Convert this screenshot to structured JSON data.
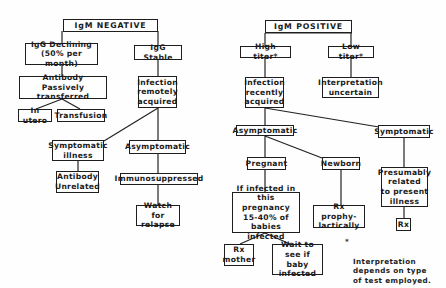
{
  "diagram": {
    "left_tree": {
      "root": "IgM NEGATIVE",
      "igg_declining": "IgG Declining\n(50% per month)",
      "igg_stable": "IgG Stable",
      "antibody_passive": "Antibody\nPassively transferred",
      "in_utero": "In utero",
      "transfusion": "Transfusion",
      "infection_remote": "Infection\nremotely\nacquired",
      "symptomatic_illness": "Symptomatic\nillness",
      "asymptomatic": "Asymptomatic",
      "antibody_unrelated": "Antibody\nUnrelated",
      "immunosuppressed": "Immunosuppressed",
      "watch_relapse": "Watch for\nrelapse"
    },
    "right_tree": {
      "root": "IgM POSITIVE",
      "high_titer": "High titer*",
      "low_titer": "Low titer*",
      "infection_recent": "Infection\nrecently\nacquired",
      "interpretation_uncertain": "Interpretation\nuncertain",
      "asymptomatic": "Asymptomatic",
      "symptomatic": "Symptomatic",
      "pregnant": "Pregnant",
      "newborn": "Newborn",
      "presumably_related": "Presumably\nrelated\nto present\nillness",
      "if_infected": "If infected in\nthis pregnancy\n15-40% of\nbabies infected",
      "rx_prophylactically": "Rx prophy-\nlactically",
      "rx": "Rx",
      "rx_mother": "Rx\nmother",
      "wait_see": "Wait to\nsee if baby\ninfected"
    },
    "footnote": {
      "star": "*",
      "text": "Interpretation\ndepends on type\nof test employed."
    }
  }
}
